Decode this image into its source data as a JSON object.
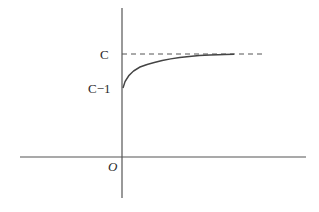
{
  "diagram": {
    "type": "function-graph",
    "labels": {
      "asymptote": "C",
      "intercept": "C−1",
      "origin": "O"
    },
    "colors": {
      "axis": "#555555",
      "curve": "#444444",
      "dash": "#555555",
      "text": "#2a2a2a"
    },
    "elements": [
      {
        "name": "x-axis",
        "kind": "line"
      },
      {
        "name": "y-axis",
        "kind": "line"
      },
      {
        "name": "asymptote-line",
        "kind": "dashed-line",
        "value": "C"
      },
      {
        "name": "curve",
        "kind": "concave-increasing",
        "start": "C−1",
        "limit": "C"
      }
    ]
  }
}
